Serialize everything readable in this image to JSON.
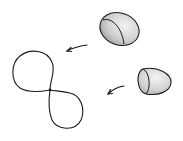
{
  "diagram": {
    "colors": {
      "background": "#ffffff",
      "stroke": "#1a1a1a",
      "shade_light": "#e6e6e6",
      "shade_dark": "#a8a8a8"
    },
    "elements": [
      {
        "id": "ellipsoid-upper",
        "type": "shaded-ellipsoid"
      },
      {
        "id": "ellipsoid-lower",
        "type": "shaded-ellipsoid"
      },
      {
        "id": "arrow-upper",
        "type": "curved-arrow",
        "direction": "left-down"
      },
      {
        "id": "arrow-lower",
        "type": "curved-arrow",
        "direction": "left-down"
      },
      {
        "id": "figure-eight-curve",
        "type": "two-lobed-loop"
      }
    ]
  }
}
